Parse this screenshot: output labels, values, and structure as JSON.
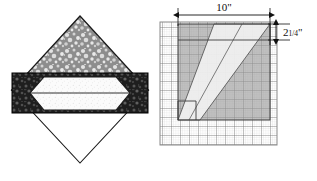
{
  "figure": {
    "left_diagram": {
      "name": "log-cross-section",
      "description": "diamond log cross-section with board band",
      "diamond": {
        "apex_top": [
          80,
          16
        ],
        "apex_left": [
          12,
          90
        ],
        "apex_right": [
          148,
          90
        ],
        "apex_bottom": [
          80,
          163
        ],
        "top_fill": "aggregate-stipple-gray",
        "bottom_fill": "#ffffff",
        "outline_color": "#1a1a1a"
      },
      "band": {
        "name": "board-band",
        "x": 12,
        "y": 73,
        "width": 136,
        "height": 40,
        "fill": "dark-bark-texture",
        "outline_color": "#000000"
      },
      "inner_hexagon": {
        "name": "board-void",
        "fill": "#fdfdfd",
        "outline_color": "#1a1a1a",
        "points": "44,77 116,77 130,93 116,110 44,110 30,93"
      }
    },
    "right_diagram": {
      "name": "grid-plan-view",
      "grid": {
        "x": 160,
        "y": 22,
        "width": 117,
        "height": 123,
        "minor_cell": 2.25,
        "major_cell": 9,
        "minor_color": "#c9c9c9",
        "major_color": "#6e6e6e",
        "border_color": "#8a8a8a",
        "background": "#ffffff"
      },
      "shaded_square": {
        "name": "shaded-region",
        "x": 178,
        "y": 24,
        "width": 92,
        "height": 96,
        "fill": "#9a9a9a",
        "opacity": 0.62
      },
      "diagonal_band": {
        "name": "diagonal-board-band",
        "fill": "#f2f2f2",
        "opacity": 0.9,
        "line_color": "#4a4a4a",
        "points": "178,120 214,24 270,24 200,120"
      },
      "notch": {
        "name": "step-notch",
        "points": "178,120 178,101 196,101 196,120",
        "line_color": "#3d3d3d"
      },
      "dimensions": {
        "horizontal": {
          "name": "width-dimension",
          "label": "10",
          "unit": "\"",
          "x1": 178,
          "x2": 270,
          "y": 14
        },
        "vertical": {
          "name": "thickness-dimension",
          "label_whole": "2",
          "label_fraction": "1/4",
          "unit": "\"",
          "y1": 24,
          "y2": 40,
          "x": 282
        }
      }
    }
  }
}
